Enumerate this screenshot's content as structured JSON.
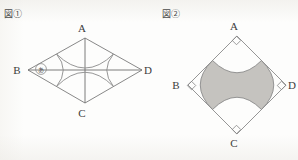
{
  "page": {
    "width": 298,
    "height": 160,
    "background_color": "#fdfdfc",
    "stroke_color": "#7a7a7a",
    "label_color": "#3c3c3c",
    "shade_color": "#b5b2ad"
  },
  "figures": [
    {
      "id": "figure-1",
      "caption": "図①",
      "shape": "rhombus",
      "shaded": false,
      "diagonals_drawn": true,
      "vertices": [
        {
          "name": "A",
          "label": "A",
          "position": "top",
          "x": 85,
          "y": 38,
          "label_x": 82,
          "label_y": 32
        },
        {
          "name": "B",
          "label": "B",
          "position": "left",
          "x": 28,
          "y": 70,
          "label_x": 17,
          "label_y": 74
        },
        {
          "name": "C",
          "label": "C",
          "position": "bottom",
          "x": 85,
          "y": 103,
          "label_x": 82,
          "label_y": 117
        },
        {
          "name": "D",
          "label": "D",
          "position": "right",
          "x": 142,
          "y": 70,
          "label_x": 146,
          "label_y": 74
        }
      ],
      "arcs": 4,
      "region_markers": [
        {
          "name": "region-a",
          "label": "あ",
          "x": 41,
          "y": 69
        }
      ]
    },
    {
      "id": "figure-2",
      "caption": "図②",
      "shape": "square-rotated",
      "shaded": true,
      "diagonals_drawn": false,
      "vertices": [
        {
          "name": "A",
          "label": "A",
          "position": "top",
          "x": 85,
          "y": 36,
          "label_x": 82,
          "label_y": 30
        },
        {
          "name": "B",
          "label": "B",
          "position": "left",
          "x": 36,
          "y": 85,
          "label_x": 24,
          "label_y": 89
        },
        {
          "name": "C",
          "label": "C",
          "position": "bottom",
          "x": 85,
          "y": 134,
          "label_x": 82,
          "label_y": 147
        },
        {
          "name": "D",
          "label": "D",
          "position": "right",
          "x": 134,
          "y": 85,
          "label_x": 138,
          "label_y": 89
        }
      ],
      "arcs": 4,
      "right_angle_marks": 4,
      "region_markers": []
    }
  ]
}
